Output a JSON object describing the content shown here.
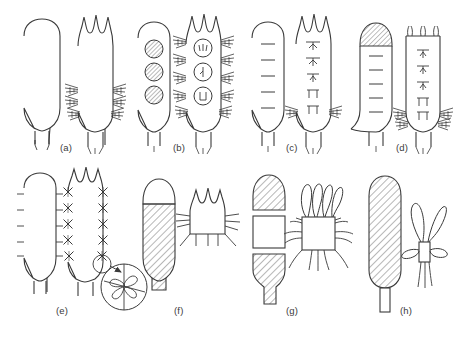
{
  "figure": {
    "domain": "scientific-line-drawing",
    "background_color": "#ffffff",
    "stroke_color": "#3a3a3a",
    "hatch_color": "#6a6a6a",
    "width": 465,
    "height": 337,
    "rows": 2,
    "columns": 4
  },
  "panels": [
    {
      "id": "a",
      "label": "(a)",
      "label_x": 60,
      "label_y": 148,
      "left_figure": {
        "name": "smooth-elongate-body",
        "outline": "rounded-oval-with-tapered-stalk",
        "surface": "smooth",
        "apex": "rounded",
        "fill": "none"
      },
      "right_figure": {
        "name": "lobed-body-with-bristle-tufts",
        "outline": "three-lobed-apex-with-tapered-stalk",
        "surface": "bristled",
        "apex": "three-lobed",
        "bristle_tufts": 4,
        "fill": "none"
      }
    },
    {
      "id": "b",
      "label": "(b)",
      "label_x": 175,
      "label_y": 148,
      "left_figure": {
        "name": "body-with-hatched-discs",
        "outline": "rounded-oval-with-tapered-stalk",
        "surface": "smooth",
        "inclusions": "three-hatched-circles",
        "inclusion_count": 3,
        "fill": "none"
      },
      "right_figure": {
        "name": "lobed-body-with-marked-discs-and-bristles",
        "outline": "three-lobed-apex-with-tapered-stalk",
        "surface": "bristled",
        "inclusions": "three-open-circles-with-internal-marks",
        "inclusion_count": 3,
        "bristle_tufts": 6,
        "fill": "none"
      }
    },
    {
      "id": "c",
      "label": "(c)",
      "label_x": 288,
      "label_y": 148,
      "left_figure": {
        "name": "body-with-transverse-septa",
        "outline": "rounded-oval-with-tapered-stalk",
        "surface": "smooth",
        "inclusions": "five-horizontal-line-segments",
        "inclusion_count": 5,
        "fill": "none"
      },
      "right_figure": {
        "name": "lobed-body-with-anchor-marks",
        "outline": "three-lobed-apex-with-tapered-stalk",
        "surface": "sparsely-bristled",
        "inclusions": "five-t-shaped-to-paired-marks",
        "inclusion_count": 5,
        "bristle_tufts": 2,
        "fill": "none"
      }
    },
    {
      "id": "d",
      "label": "(d)",
      "label_x": 398,
      "label_y": 148,
      "left_figure": {
        "name": "body-with-hatched-apical-cap",
        "outline": "rounded-body-with-tapered-stalk",
        "surface": "smooth",
        "apex": "hatched-dome-cap",
        "inclusions": "five-horizontal-line-segments",
        "inclusion_count": 5,
        "fill": "none"
      },
      "right_figure": {
        "name": "squared-body-with-apical-horns-and-marks",
        "outline": "rectangular-body-with-tapered-stalk",
        "surface": "bristled-lower",
        "apex": "three-short-horns",
        "inclusions": "five-anchor-marks",
        "inclusion_count": 5,
        "bristle_tufts": 4,
        "fill": "none"
      }
    },
    {
      "id": "e",
      "label": "(e)",
      "label_x": 58,
      "label_y": 314,
      "left_figure": {
        "name": "body-with-marginal-ticks",
        "outline": "rounded-oval-with-tapered-stalk",
        "surface": "ticked-margins",
        "tick_pairs": 6,
        "fill": "none"
      },
      "right_figure": {
        "name": "lobed-body-with-cross-shaped-spines",
        "outline": "three-lobed-apex-with-tapered-stalk",
        "surface": "cross-spined-margins",
        "spine_pairs": 6,
        "fill": "none"
      },
      "inset": {
        "name": "spine-detail-inset",
        "shape": "circle",
        "content": "pinwheel-spine-with-radiating-blades",
        "blade_count": 5,
        "callout": "arrow-from-small-circle-to-large-circle"
      }
    },
    {
      "id": "f",
      "label": "(f)",
      "label_x": 176,
      "label_y": 314,
      "left_figure": {
        "name": "hatched-body-with-clear-dome-cap",
        "outline": "domed-cap-over-hatched-body",
        "surface": "hatched",
        "apex": "clear-dome-cap",
        "fill": "diagonal-hatch"
      },
      "right_figure": {
        "name": "short-lobed-body-with-lateral-bristles",
        "outline": "three-lobed-apex-short-box-body",
        "surface": "bristled",
        "bristle_tufts": 4,
        "fill": "none"
      }
    },
    {
      "id": "g",
      "label": "(g)",
      "label_x": 288,
      "label_y": 314,
      "left_figure": {
        "name": "segmented-body-hatched-clear-hatched",
        "outline": "three-segments-stacked",
        "segments": [
          "hatched-dome-top",
          "clear-rectangle-middle",
          "hatched-tapered-base"
        ],
        "fill": "diagonal-hatch-partial"
      },
      "right_figure": {
        "name": "box-body-with-four-apical-loops",
        "outline": "square-box-with-loops",
        "apical_loops": 4,
        "lateral_bristles": 6,
        "fill": "none"
      }
    },
    {
      "id": "h",
      "label": "(h)",
      "label_x": 402,
      "label_y": 314,
      "left_figure": {
        "name": "fully-hatched-elongate-body",
        "outline": "elongate-oval-with-rectangular-stalk",
        "surface": "fully-hatched",
        "fill": "diagonal-hatch"
      },
      "right_figure": {
        "name": "small-body-with-paired-loops",
        "outline": "narrow-box-body",
        "large_loops": 2,
        "small_loops": 2,
        "tail_filaments": 3,
        "fill": "none"
      }
    }
  ]
}
